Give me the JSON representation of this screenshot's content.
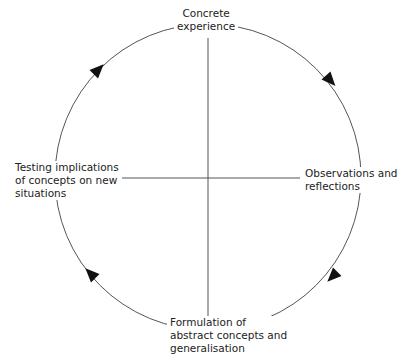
{
  "diagram": {
    "type": "cycle",
    "stages": [
      {
        "id": "top",
        "lines": [
          "Concrete",
          "experience"
        ]
      },
      {
        "id": "right",
        "lines": [
          "Observations and",
          "reflections"
        ]
      },
      {
        "id": "bottom",
        "lines": [
          "Formulation of",
          "abstract concepts and",
          "generalisation"
        ]
      },
      {
        "id": "left",
        "lines": [
          "Testing implications",
          "of concepts on new",
          "situations"
        ]
      }
    ],
    "direction": "clockwise",
    "line_color": "#555555",
    "arrow_color": "#111111"
  }
}
